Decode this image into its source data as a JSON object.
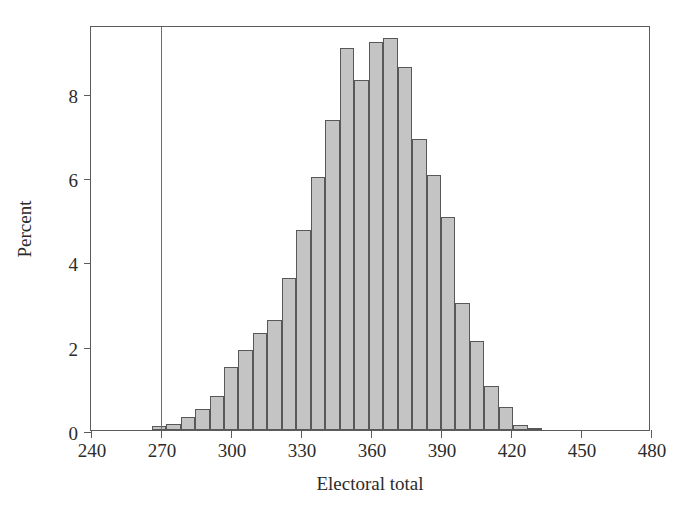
{
  "chart_data": {
    "type": "bar",
    "title": "",
    "subtitle": "",
    "xlabel": "Electoral total",
    "ylabel": "Percent",
    "xlim": [
      240,
      480
    ],
    "ylim": [
      0,
      9.6
    ],
    "grid": false,
    "legend": null,
    "xticks": [
      240,
      270,
      300,
      330,
      360,
      390,
      420,
      450,
      480
    ],
    "yticks": [
      0,
      2,
      4,
      6,
      8
    ],
    "bin_width": 6.2,
    "bar_color": "#c4c4c4",
    "bar_edge_color": "#585858",
    "annotations": [
      {
        "name": "electoral-majority-reference-line",
        "type": "vline",
        "x": 270,
        "color": "#6e6e6e"
      }
    ],
    "categories": [
      269.1,
      275.3,
      281.5,
      287.7,
      293.9,
      300.1,
      306.3,
      312.5,
      318.7,
      324.9,
      331.1,
      337.3,
      343.5,
      349.7,
      355.9,
      362.1,
      368.3,
      374.5,
      380.7,
      386.9,
      393.1,
      399.3,
      405.5,
      411.7,
      417.9
    ],
    "values": [
      0.1,
      0.15,
      0.3,
      0.5,
      0.8,
      1.5,
      1.9,
      2.3,
      2.6,
      3.6,
      4.75,
      6.0,
      7.35,
      9.05,
      8.3,
      9.2,
      9.3,
      8.6,
      6.9,
      6.05,
      5.05,
      3.0,
      2.1,
      1.05,
      0.55
    ],
    "tail_values": [
      0.12,
      0.05
    ],
    "tail_categories": [
      424.1,
      430.3
    ]
  },
  "axes": {
    "x_tick_labels": [
      "240",
      "270",
      "300",
      "330",
      "360",
      "390",
      "420",
      "450",
      "480"
    ],
    "y_tick_labels": [
      "0",
      "2",
      "4",
      "6",
      "8"
    ],
    "x_axis_title": "Electoral total",
    "y_axis_title": "Percent"
  }
}
